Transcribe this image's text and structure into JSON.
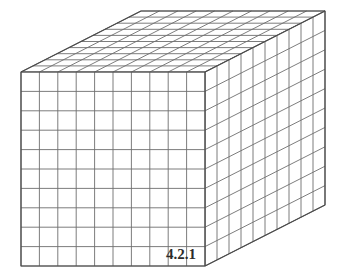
{
  "figure": {
    "kind": "unit-cube-array-diagram",
    "label": "4.2.1",
    "label_position": {
      "x": 166,
      "y": 247
    },
    "canvas": {
      "width": 346,
      "height": 280,
      "background": "#ffffff"
    },
    "colors": {
      "grid_line": "#6e6e6e",
      "outline": "#4a4a4a",
      "face_fill": "#ffffff",
      "label_text": "#2b2b2b"
    },
    "geometry": {
      "projection": "oblique",
      "front_face": {
        "left": 21,
        "top": 72,
        "right": 205,
        "bottom": 266,
        "columns": 10,
        "rows": 10
      },
      "depth_offset": {
        "dx": 120,
        "dy": -61
      },
      "depth_divisions": 10
    },
    "structure": {
      "width_cubes": 10,
      "height_cubes": 10,
      "depth_cubes": 10,
      "total_cubes": 1000
    },
    "faces": [
      {
        "name": "front-face",
        "visible": true
      },
      {
        "name": "top-face",
        "visible": true
      },
      {
        "name": "right-face",
        "visible": true
      }
    ]
  }
}
